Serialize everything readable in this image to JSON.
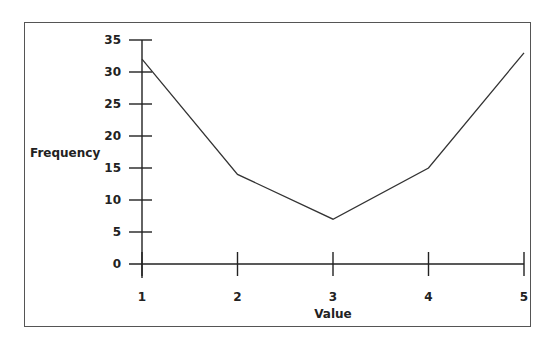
{
  "chart_data": {
    "type": "line",
    "title": "",
    "xlabel": "Value",
    "ylabel": "Frequency",
    "categories": [
      "1",
      "2",
      "3",
      "4",
      "5"
    ],
    "x": [
      1,
      2,
      3,
      4,
      5
    ],
    "series": [
      {
        "name": "Frequency",
        "values": [
          32,
          14,
          7,
          15,
          33
        ]
      }
    ],
    "ylim": [
      0,
      35
    ],
    "yticks": [
      0,
      5,
      10,
      15,
      20,
      25,
      30,
      35
    ],
    "xticks": [
      1,
      2,
      3,
      4,
      5
    ],
    "grid": false,
    "legend": null
  },
  "axes": {
    "x_title": "Value",
    "y_title": "Frequency"
  }
}
